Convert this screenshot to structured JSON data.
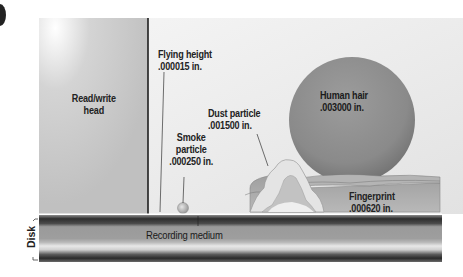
{
  "diagram": {
    "head": {
      "label_line1": "Read/write",
      "label_line2": "head"
    },
    "flying_height": {
      "label": "Flying height",
      "value": ".000015 in."
    },
    "smoke_particle": {
      "label_line1": "Smoke",
      "label_line2": "particle",
      "value": ".000250 in."
    },
    "dust_particle": {
      "label": "Dust particle",
      "value": ".001500 in."
    },
    "human_hair": {
      "label": "Human hair",
      "value": ".003000 in."
    },
    "fingerprint": {
      "label": "Fingerprint",
      "value": ".000620 in."
    },
    "disk": {
      "label": "Disk",
      "recording_medium_label": "Recording medium"
    },
    "colors": {
      "background": "#e8e8e8",
      "head": "#c8c8c8",
      "hair": "#8a8a8a",
      "dust": "#e4e4e4",
      "fingerprint": "#a8a8a8",
      "disk_dark": "#3a3a3a",
      "disk_mid": "#9a9a9a"
    }
  }
}
